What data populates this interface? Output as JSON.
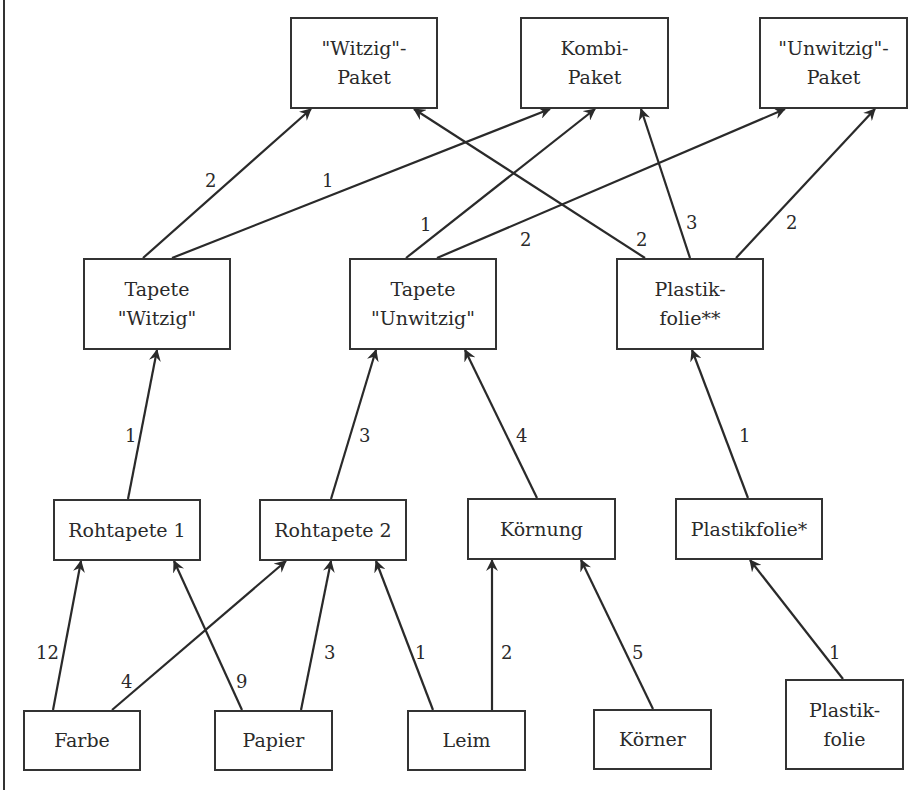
{
  "diagram": {
    "type": "bill-of-materials graph (Gozinto-Graph)",
    "nodes": [
      {
        "id": "witzig_paket",
        "label": "\"Witzig\"-\nPaket",
        "x": 290,
        "y": 17,
        "w": 148,
        "h": 92
      },
      {
        "id": "kombi_paket",
        "label": "Kombi-\nPaket",
        "x": 520,
        "y": 17,
        "w": 149,
        "h": 92
      },
      {
        "id": "unwitzig_paket",
        "label": "\"Unwitzig\"-\nPaket",
        "x": 759,
        "y": 17,
        "w": 149,
        "h": 92
      },
      {
        "id": "tapete_witzig",
        "label": "Tapete\n\"Witzig\"",
        "x": 83,
        "y": 258,
        "w": 148,
        "h": 92
      },
      {
        "id": "tapete_unwitzig",
        "label": "Tapete\n\"Unwitzig\"",
        "x": 349,
        "y": 258,
        "w": 148,
        "h": 92
      },
      {
        "id": "plastikfolie_2",
        "label": "Plastik-\nfolie**",
        "x": 616,
        "y": 258,
        "w": 148,
        "h": 92
      },
      {
        "id": "rohtapete_1",
        "label": "Rohtapete 1",
        "x": 53,
        "y": 499,
        "w": 148,
        "h": 62
      },
      {
        "id": "rohtapete_2",
        "label": "Rohtapete 2",
        "x": 259,
        "y": 499,
        "w": 148,
        "h": 62
      },
      {
        "id": "koernung",
        "label": "Körnung",
        "x": 467,
        "y": 498,
        "w": 149,
        "h": 62
      },
      {
        "id": "plastikfolie_1",
        "label": "Plastikfolie*",
        "x": 675,
        "y": 498,
        "w": 148,
        "h": 62
      },
      {
        "id": "farbe",
        "label": "Farbe",
        "x": 23,
        "y": 710,
        "w": 118,
        "h": 61
      },
      {
        "id": "papier",
        "label": "Papier",
        "x": 214,
        "y": 710,
        "w": 119,
        "h": 61
      },
      {
        "id": "leim",
        "label": "Leim",
        "x": 407,
        "y": 710,
        "w": 119,
        "h": 61
      },
      {
        "id": "koerner",
        "label": "Körner",
        "x": 593,
        "y": 709,
        "w": 119,
        "h": 61
      },
      {
        "id": "plastikfolie",
        "label": "Plastik-\nfolie",
        "x": 785,
        "y": 679,
        "w": 119,
        "h": 91
      }
    ],
    "edges": [
      {
        "from": "tapete_witzig",
        "to": "witzig_paket",
        "qty": "2",
        "x1": 143,
        "y1": 258,
        "x2": 311,
        "y2": 109,
        "lx": 205,
        "ly": 171
      },
      {
        "from": "tapete_witzig",
        "to": "kombi_paket",
        "qty": "1",
        "x1": 172,
        "y1": 258,
        "x2": 550,
        "y2": 109,
        "lx": 322,
        "ly": 171
      },
      {
        "from": "tapete_unwitzig",
        "to": "kombi_paket",
        "qty": "1",
        "x1": 406,
        "y1": 258,
        "x2": 595,
        "y2": 109,
        "lx": 420,
        "ly": 215
      },
      {
        "from": "tapete_unwitzig",
        "to": "unwitzig_paket",
        "qty": "2",
        "x1": 437,
        "y1": 258,
        "x2": 785,
        "y2": 109,
        "lx": 520,
        "ly": 230
      },
      {
        "from": "plastikfolie_2",
        "to": "witzig_paket",
        "qty": "2",
        "x1": 645,
        "y1": 258,
        "x2": 414,
        "y2": 109,
        "lx": 636,
        "ly": 230
      },
      {
        "from": "plastikfolie_2",
        "to": "kombi_paket",
        "qty": "3",
        "x1": 690,
        "y1": 258,
        "x2": 641,
        "y2": 109,
        "lx": 686,
        "ly": 213
      },
      {
        "from": "plastikfolie_2",
        "to": "unwitzig_paket",
        "qty": "2",
        "x1": 736,
        "y1": 258,
        "x2": 875,
        "y2": 109,
        "lx": 786,
        "ly": 213
      },
      {
        "from": "rohtapete_1",
        "to": "tapete_witzig",
        "qty": "1",
        "x1": 128,
        "y1": 499,
        "x2": 157,
        "y2": 350,
        "lx": 125,
        "ly": 426
      },
      {
        "from": "rohtapete_2",
        "to": "tapete_unwitzig",
        "qty": "3",
        "x1": 331,
        "y1": 499,
        "x2": 376,
        "y2": 350,
        "lx": 359,
        "ly": 426
      },
      {
        "from": "koernung",
        "to": "tapete_unwitzig",
        "qty": "4",
        "x1": 537,
        "y1": 498,
        "x2": 465,
        "y2": 350,
        "lx": 516,
        "ly": 426
      },
      {
        "from": "plastikfolie_1",
        "to": "plastikfolie_2",
        "qty": "1",
        "x1": 748,
        "y1": 498,
        "x2": 692,
        "y2": 350,
        "lx": 739,
        "ly": 426
      },
      {
        "from": "farbe",
        "to": "rohtapete_1",
        "qty": "12",
        "x1": 53,
        "y1": 710,
        "x2": 81,
        "y2": 561,
        "lx": 36,
        "ly": 643
      },
      {
        "from": "farbe",
        "to": "rohtapete_2",
        "qty": "4",
        "x1": 112,
        "y1": 710,
        "x2": 286,
        "y2": 561,
        "lx": 121,
        "ly": 672
      },
      {
        "from": "papier",
        "to": "rohtapete_1",
        "qty": "9",
        "x1": 242,
        "y1": 710,
        "x2": 174,
        "y2": 561,
        "lx": 236,
        "ly": 672
      },
      {
        "from": "papier",
        "to": "rohtapete_2",
        "qty": "3",
        "x1": 301,
        "y1": 710,
        "x2": 331,
        "y2": 561,
        "lx": 324,
        "ly": 643
      },
      {
        "from": "leim",
        "to": "rohtapete_2",
        "qty": "1",
        "x1": 433,
        "y1": 710,
        "x2": 376,
        "y2": 561,
        "lx": 415,
        "ly": 643
      },
      {
        "from": "leim",
        "to": "koernung",
        "qty": "2",
        "x1": 492,
        "y1": 710,
        "x2": 492,
        "y2": 560,
        "lx": 501,
        "ly": 643
      },
      {
        "from": "koerner",
        "to": "koernung",
        "qty": "5",
        "x1": 653,
        "y1": 709,
        "x2": 581,
        "y2": 560,
        "lx": 632,
        "ly": 643
      },
      {
        "from": "plastikfolie",
        "to": "plastikfolie_1",
        "qty": "1",
        "x1": 843,
        "y1": 679,
        "x2": 750,
        "y2": 560,
        "lx": 829,
        "ly": 643
      }
    ],
    "colors": {
      "line": "#2a2a2a",
      "text": "#2a2a2a",
      "background": "#ffffff"
    }
  }
}
